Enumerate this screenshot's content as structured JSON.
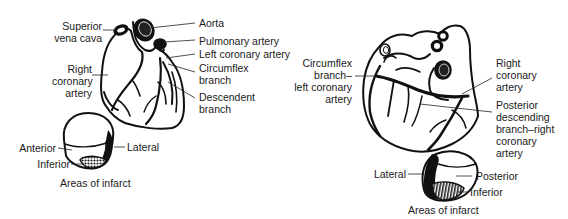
{
  "figure": {
    "left_view": {
      "labels": {
        "superior_vena_cava": [
          "Superior",
          "vena cava"
        ],
        "right_coronary_artery": [
          "Right",
          "coronary",
          "artery"
        ],
        "aorta": "Aorta",
        "pulmonary_artery": "Pulmonary artery",
        "left_coronary_artery": "Left coronary artery",
        "circumflex_branch": [
          "Circumflex",
          "branch"
        ],
        "descendent_branch": [
          "Descendent",
          "branch"
        ]
      },
      "infarct_diagram": {
        "anterior": "Anterior",
        "inferior": "Inferior",
        "lateral": "Lateral",
        "caption": "Areas of infarct"
      }
    },
    "right_view": {
      "labels": {
        "circumflex_branch_left_coronary": [
          "Circumflex",
          "branch–",
          "left coronary",
          "artery"
        ],
        "right_coronary_artery": [
          "Right",
          "coronary",
          "artery"
        ],
        "posterior_descending_branch": [
          "Posterior",
          "descending",
          "branch–right",
          "coronary",
          "artery"
        ]
      },
      "infarct_diagram": {
        "lateral": "Lateral",
        "posterior": "Posterior",
        "inferior": "Inferior",
        "caption": "Areas of infarct"
      }
    }
  }
}
